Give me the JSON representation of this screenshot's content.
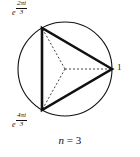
{
  "figure": {
    "caption": {
      "variable": "n",
      "equals": "=",
      "value": "3",
      "full_text": "n = 3"
    },
    "background_color": "#ffffff",
    "stroke_color": "#111111",
    "circle": {
      "center_x": 65,
      "center_y": 69,
      "radius": 47,
      "stroke_width": 1.1
    },
    "triangle": {
      "stroke_width": 2.6,
      "sides": 3
    },
    "radii": {
      "style": "dashed",
      "stroke_width": 0.8,
      "dash_pattern": "2,2"
    },
    "vertices": [
      {
        "name": "vertex-1",
        "angle_degrees": 0,
        "x": 112,
        "y": 69,
        "label_text": "1",
        "label_position": "right"
      },
      {
        "name": "vertex-e-2pi-i-3",
        "angle_degrees": 120,
        "x": 42,
        "y": 28,
        "label_base": "e",
        "label_numerator": "2πi",
        "label_denominator": "3",
        "label_text": "e^(2πi/3)",
        "label_position": "top-left"
      },
      {
        "name": "vertex-e-4pi-i-3",
        "angle_degrees": 240,
        "x": 42,
        "y": 110,
        "label_base": "e",
        "label_numerator": "4πi",
        "label_denominator": "3",
        "label_text": "e^(4πi/3)",
        "label_position": "bottom-left"
      }
    ]
  }
}
